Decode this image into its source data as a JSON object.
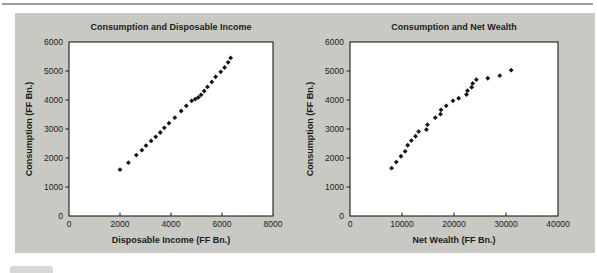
{
  "page": {
    "background": "#ffffff",
    "top_rule_color": "#9c9c9c",
    "panel_background": "#c7c9c2",
    "text_color": "#1c1c1c",
    "frame_color": "#1c1c1c",
    "plot_background": "#ffffff",
    "marker_color": "#141414"
  },
  "chart_data": [
    {
      "type": "scatter",
      "title": "Consumption and Disposable Income",
      "xlabel": "Disposable Income (FF Bn.)",
      "ylabel": "Consumption (FF Bn.)",
      "xlim": [
        0,
        8000
      ],
      "ylim": [
        0,
        6000
      ],
      "xticks": [
        0,
        2000,
        4000,
        6000,
        8000
      ],
      "yticks": [
        0,
        1000,
        2000,
        3000,
        4000,
        5000,
        6000
      ],
      "grid": false,
      "legend": "none",
      "marker": "diamond",
      "points": [
        [
          2000,
          1600
        ],
        [
          2330,
          1840
        ],
        [
          2640,
          2100
        ],
        [
          2860,
          2270
        ],
        [
          3020,
          2430
        ],
        [
          3220,
          2590
        ],
        [
          3400,
          2730
        ],
        [
          3580,
          2880
        ],
        [
          3740,
          3040
        ],
        [
          3920,
          3200
        ],
        [
          4150,
          3390
        ],
        [
          4400,
          3620
        ],
        [
          4600,
          3800
        ],
        [
          4810,
          3970
        ],
        [
          4950,
          4030
        ],
        [
          5070,
          4090
        ],
        [
          5180,
          4180
        ],
        [
          5300,
          4310
        ],
        [
          5430,
          4450
        ],
        [
          5600,
          4620
        ],
        [
          5750,
          4800
        ],
        [
          5950,
          4970
        ],
        [
          6100,
          5120
        ],
        [
          6240,
          5300
        ],
        [
          6340,
          5450
        ]
      ]
    },
    {
      "type": "scatter",
      "title": "Consumption and Net Wealth",
      "xlabel": "Net Wealth (FF Bn.)",
      "ylabel": "Consumption (FF Bn.)",
      "xlim": [
        0,
        40000
      ],
      "ylim": [
        0,
        6000
      ],
      "xticks": [
        0,
        10000,
        20000,
        30000,
        40000
      ],
      "yticks": [
        0,
        1000,
        2000,
        3000,
        4000,
        5000,
        6000
      ],
      "grid": false,
      "legend": "none",
      "marker": "diamond",
      "points": [
        [
          8000,
          1650
        ],
        [
          8900,
          1860
        ],
        [
          9800,
          2060
        ],
        [
          10600,
          2230
        ],
        [
          11100,
          2440
        ],
        [
          11800,
          2600
        ],
        [
          12600,
          2750
        ],
        [
          13200,
          2910
        ],
        [
          14700,
          2980
        ],
        [
          14900,
          3150
        ],
        [
          16400,
          3390
        ],
        [
          17400,
          3510
        ],
        [
          17500,
          3660
        ],
        [
          18500,
          3800
        ],
        [
          19800,
          3970
        ],
        [
          20900,
          4060
        ],
        [
          22400,
          4190
        ],
        [
          22600,
          4320
        ],
        [
          23400,
          4440
        ],
        [
          23600,
          4570
        ],
        [
          24300,
          4700
        ],
        [
          26500,
          4750
        ],
        [
          28800,
          4840
        ],
        [
          31000,
          5030
        ]
      ]
    }
  ]
}
